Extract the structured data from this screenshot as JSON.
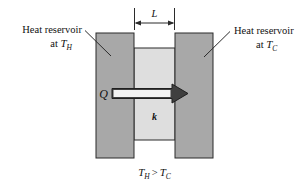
{
  "figure": {
    "labels": {
      "left_reservoir_line1": "Heat reservoir",
      "left_reservoir_line2_prefix": "at ",
      "left_reservoir_temp_symbol": "T",
      "left_reservoir_temp_subscript": "H",
      "right_reservoir_line1": "Heat reservoir",
      "right_reservoir_line2_prefix": "at ",
      "right_reservoir_temp_symbol": "T",
      "right_reservoir_temp_subscript": "C",
      "thickness_symbol": "L",
      "heat_flow_symbol": "Q",
      "conductivity_symbol": "k",
      "caption_hot_symbol": "T",
      "caption_hot_subscript": "H",
      "caption_operator": ">",
      "caption_cold_symbol": "T",
      "caption_cold_subscript": "C"
    },
    "colors": {
      "reservoir_fill": "#a8a8a8",
      "wall_fill": "#dedede",
      "outline": "#2b2b2b",
      "arrow_fill": "#3a3a3a",
      "text": "#111111",
      "background": "#ffffff"
    },
    "geometry": {
      "left_block": {
        "x": 96,
        "y": 33,
        "width": 38,
        "height": 125
      },
      "right_block": {
        "x": 175,
        "y": 33,
        "width": 38,
        "height": 125
      },
      "wall": {
        "x": 134,
        "y": 48,
        "width": 41,
        "height": 92
      },
      "dimension_line_y": 23,
      "arrow_y": 93
    }
  }
}
